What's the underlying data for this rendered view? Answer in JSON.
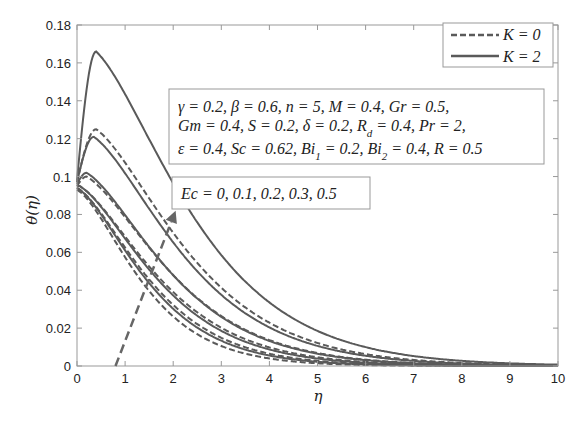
{
  "chart_data": {
    "type": "line",
    "title": "",
    "xlabel": "η",
    "ylabel": "θ(η)",
    "xlim": [
      0,
      10
    ],
    "ylim": [
      0,
      0.18
    ],
    "xticks": [
      "0",
      "1",
      "2",
      "3",
      "4",
      "5",
      "6",
      "7",
      "8",
      "9",
      "10"
    ],
    "yticks": [
      "0",
      "0.02",
      "0.04",
      "0.06",
      "0.08",
      "0.1",
      "0.12",
      "0.14",
      "0.16",
      "0.18"
    ],
    "grid": false,
    "legend": {
      "position": "upper right",
      "entries": [
        {
          "label": "K = 0",
          "style": "dashed"
        },
        {
          "label": "K = 2",
          "style": "solid"
        }
      ]
    },
    "annotations": {
      "params_line1": "γ = 0.2, β = 0.6, n = 5, M = 0.4, Gr = 0.5,",
      "params_line2": "Gm = 0.4, S = 0.2, δ = 0.2, R_d = 0.4, Pr = 2,",
      "params_line3": "ε = 0.4, Sc = 0.62, Bi_1 = 0.2, Bi_2 = 0.4, R = 0.5",
      "ec_label": "Ec = 0, 0.1, 0.2, 0.3, 0.5",
      "arrow": {
        "from": [
          0.8,
          0.0
        ],
        "to": [
          2.05,
          0.082
        ]
      }
    },
    "series": [
      {
        "name": "K=0, Ec=0",
        "style": "dashed",
        "theta0": 0.093,
        "peak": 0.093,
        "peak_eta": 0.0,
        "decay": 1.05
      },
      {
        "name": "K=0, Ec=0.1",
        "style": "dashed",
        "theta0": 0.094,
        "peak": 0.094,
        "peak_eta": 0.0,
        "decay": 0.9
      },
      {
        "name": "K=0, Ec=0.2",
        "style": "dashed",
        "theta0": 0.095,
        "peak": 0.095,
        "peak_eta": 0.05,
        "decay": 0.78
      },
      {
        "name": "K=0, Ec=0.3",
        "style": "dashed",
        "theta0": 0.095,
        "peak": 0.1,
        "peak_eta": 0.2,
        "decay": 0.72
      },
      {
        "name": "K=0, Ec=0.5",
        "style": "dashed",
        "theta0": 0.097,
        "peak": 0.125,
        "peak_eta": 0.4,
        "decay": 0.66
      },
      {
        "name": "K=2, Ec=0",
        "style": "solid",
        "theta0": 0.094,
        "peak": 0.094,
        "peak_eta": 0.0,
        "decay": 0.95
      },
      {
        "name": "K=2, Ec=0.1",
        "style": "solid",
        "theta0": 0.095,
        "peak": 0.095,
        "peak_eta": 0.05,
        "decay": 0.82
      },
      {
        "name": "K=2, Ec=0.2",
        "style": "solid",
        "theta0": 0.096,
        "peak": 0.102,
        "peak_eta": 0.2,
        "decay": 0.74
      },
      {
        "name": "K=2, Ec=0.3",
        "style": "solid",
        "theta0": 0.097,
        "peak": 0.121,
        "peak_eta": 0.35,
        "decay": 0.68
      },
      {
        "name": "K=2, Ec=0.5",
        "style": "solid",
        "theta0": 0.098,
        "peak": 0.166,
        "peak_eta": 0.4,
        "decay": 0.62
      }
    ]
  },
  "colors": {
    "line": "#5a5a5a",
    "axis": "#888888",
    "text": "#222222"
  }
}
